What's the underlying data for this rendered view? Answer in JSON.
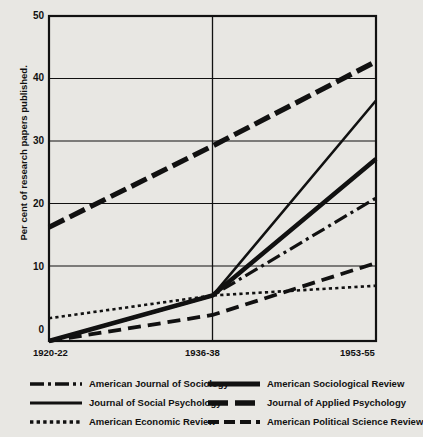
{
  "chart_data": {
    "type": "line",
    "title": "",
    "xlabel": "",
    "ylabel": "Per cent of research papers published.",
    "x": [
      "1920-22",
      "1936-38",
      "1953-55"
    ],
    "xlim": [
      0,
      2
    ],
    "ylim": [
      0,
      50
    ],
    "yticks": [
      0,
      10,
      20,
      30,
      40,
      50
    ],
    "ytick_labels": [
      "0",
      "10",
      "20",
      "30",
      "40",
      "50"
    ],
    "xtick_labels": [
      "1920-22",
      "1936-38",
      "1953-55"
    ],
    "grid": "horizontal-and-vertical-midline",
    "legend_position": "below-plot-two-columns",
    "series": [
      {
        "name": "American Journal of Sociology",
        "style": "dash-dot",
        "values": [
          0.0,
          7.0,
          22.0
        ]
      },
      {
        "name": "Journal of Social Psychology",
        "style": "solid-thin",
        "values": [
          0.0,
          7.0,
          37.0
        ]
      },
      {
        "name": "American Economic Review",
        "style": "dotted",
        "values": [
          3.5,
          7.0,
          8.5
        ]
      },
      {
        "name": "American Sociological Review",
        "style": "solid-thick",
        "values": [
          0.0,
          7.0,
          28.0
        ]
      },
      {
        "name": "Journal of Applied Psychology",
        "style": "long-dash-thick",
        "values": [
          17.5,
          30.0,
          43.0
        ]
      },
      {
        "name": "American Political Science Review",
        "style": "medium-dash",
        "values": [
          0.0,
          4.0,
          12.0
        ]
      }
    ]
  },
  "legend": {
    "columns": [
      {
        "items": [
          {
            "label": "American Journal of Sociology",
            "style": "dash-dot"
          },
          {
            "label": "Journal of Social Psychology",
            "style": "solid-thin"
          },
          {
            "label": "American Economic Review",
            "style": "dotted"
          }
        ]
      },
      {
        "items": [
          {
            "label": "American Sociological Review",
            "style": "solid-thick"
          },
          {
            "label": "Journal of Applied Psychology",
            "style": "long-dash-thick"
          },
          {
            "label": "American Political Science Review",
            "style": "medium-dash"
          }
        ]
      }
    ]
  },
  "colors": {
    "ink": "#111111",
    "paper": "#e8e7e3",
    "grid": "#111111"
  }
}
